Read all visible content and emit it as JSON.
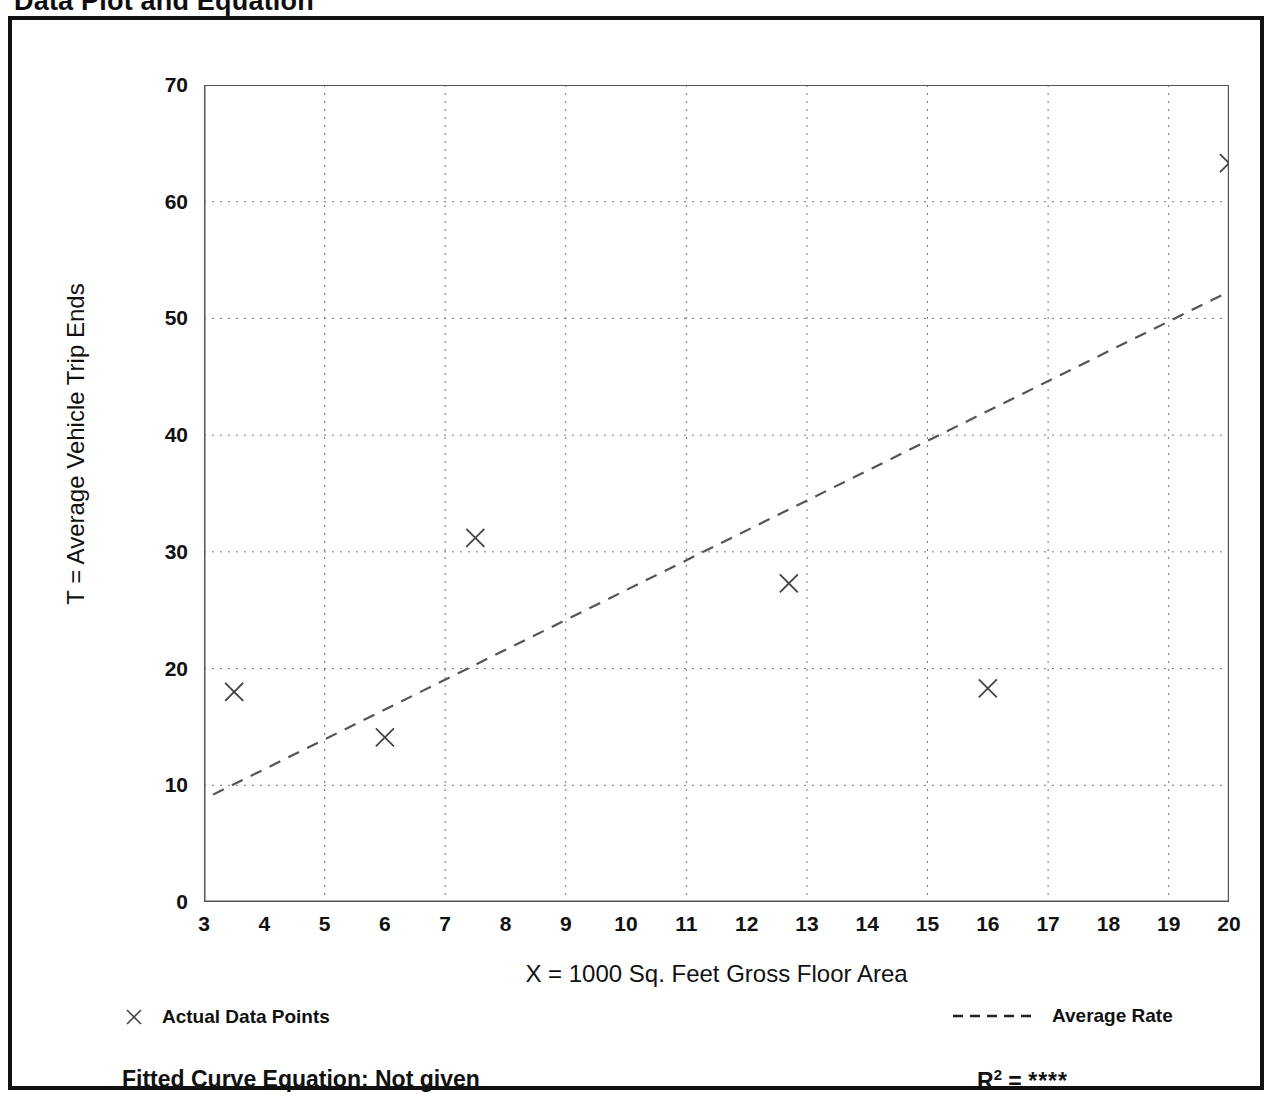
{
  "page": {
    "title": "Data Plot and Equation"
  },
  "legend": {
    "data_points_label": "Actual Data Points",
    "average_rate_label": "Average Rate",
    "marker_icon": "x-marker-icon",
    "line_icon": "dashed-line-icon"
  },
  "footer": {
    "equation_label": "Fitted Curve Equation:  Not given",
    "r2_label": "R",
    "r2_exponent": "2",
    "r2_equals": " = ",
    "r2_value": "****"
  },
  "colors": {
    "frame": "#111111",
    "axis": "#555555",
    "grid": "#777777",
    "marker": "#444444",
    "trend": "#555555",
    "text": "#111111"
  },
  "chart_data": {
    "type": "scatter",
    "title": "Data Plot and Equation",
    "xlabel": "X = 1000 Sq. Feet Gross Floor Area",
    "ylabel": "T = Average Vehicle Trip Ends",
    "xlim": [
      3,
      20
    ],
    "ylim": [
      0,
      70
    ],
    "xticks": [
      3,
      4,
      5,
      6,
      7,
      8,
      9,
      10,
      11,
      12,
      13,
      14,
      15,
      16,
      17,
      18,
      19,
      20
    ],
    "xtick_labels": [
      "3",
      "4",
      "5",
      "6",
      "7",
      "8",
      "9",
      "10",
      "11",
      "12",
      "13",
      "14",
      "15",
      "16",
      "17",
      "18",
      "19",
      "20"
    ],
    "yticks": [
      0,
      10,
      20,
      30,
      40,
      50,
      60,
      70
    ],
    "ytick_labels": [
      "0",
      "10",
      "20",
      "30",
      "40",
      "50",
      "60",
      "70"
    ],
    "y_minor_ticks": [
      5,
      15,
      25,
      35,
      45,
      55,
      65
    ],
    "x_grid_values": [
      5,
      7,
      9,
      11,
      13,
      15,
      17,
      19
    ],
    "y_grid_values": [
      10,
      20,
      30,
      40,
      50,
      60
    ],
    "grid": true,
    "legend_position": "below-plot",
    "series": [
      {
        "name": "Actual Data Points",
        "type": "scatter",
        "marker": "x",
        "points": [
          {
            "x": 3.5,
            "y": 18.0
          },
          {
            "x": 6.0,
            "y": 14.1
          },
          {
            "x": 7.5,
            "y": 31.2
          },
          {
            "x": 12.7,
            "y": 27.3
          },
          {
            "x": 16.0,
            "y": 18.3
          },
          {
            "x": 20.0,
            "y": 63.3
          }
        ]
      },
      {
        "name": "Average Rate",
        "type": "line",
        "style": "dashed",
        "x": [
          3.15,
          20.0
        ],
        "y": [
          9.2,
          52.3
        ]
      }
    ]
  }
}
